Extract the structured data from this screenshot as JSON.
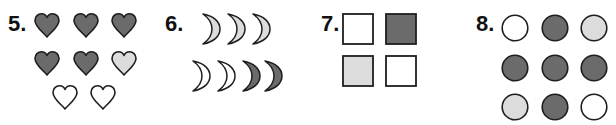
{
  "colors": {
    "dark": "#6b6b6b",
    "light": "#dcdcdc",
    "white": "#ffffff",
    "stroke": "#1e1e1e"
  },
  "problems": [
    {
      "number": "5.",
      "shape": "heart",
      "items": [
        {
          "fill": "dark"
        },
        {
          "fill": "dark"
        },
        {
          "fill": "dark"
        },
        {
          "fill": "dark"
        },
        {
          "fill": "dark"
        },
        {
          "fill": "light"
        },
        {
          "fill": "white"
        },
        {
          "fill": "white"
        }
      ]
    },
    {
      "number": "6.",
      "shape": "crescent-moon",
      "items": [
        {
          "fill": "light"
        },
        {
          "fill": "light"
        },
        {
          "fill": "light"
        },
        {
          "fill": "white"
        },
        {
          "fill": "white"
        },
        {
          "fill": "dark"
        },
        {
          "fill": "dark"
        }
      ]
    },
    {
      "number": "7.",
      "shape": "square",
      "items": [
        {
          "fill": "white"
        },
        {
          "fill": "dark"
        },
        {
          "fill": "light"
        },
        {
          "fill": "white"
        }
      ]
    },
    {
      "number": "8.",
      "shape": "circle",
      "items": [
        {
          "fill": "white"
        },
        {
          "fill": "dark"
        },
        {
          "fill": "light"
        },
        {
          "fill": "dark"
        },
        {
          "fill": "dark"
        },
        {
          "fill": "dark"
        },
        {
          "fill": "light"
        },
        {
          "fill": "dark"
        },
        {
          "fill": "white"
        }
      ]
    }
  ]
}
